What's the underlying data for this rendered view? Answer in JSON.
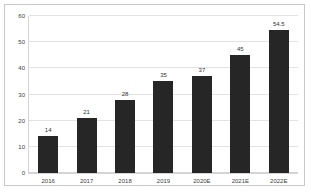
{
  "chart_data": {
    "type": "bar",
    "title": "",
    "subtitle": "",
    "xlabel": "",
    "ylabel": "",
    "categories": [
      "2016",
      "2017",
      "2018",
      "2019",
      "2020E",
      "2021E",
      "2022E"
    ],
    "values": [
      14,
      21,
      28,
      35,
      37,
      45,
      54.5
    ],
    "data_labels": [
      "14",
      "21",
      "28",
      "35",
      "37",
      "45",
      "54.5"
    ],
    "ylim": [
      0,
      60
    ],
    "ytick_labels": [
      "0",
      "10",
      "20",
      "30",
      "40",
      "50",
      "60"
    ],
    "ytick_values": [
      0,
      10,
      20,
      30,
      40,
      50,
      60
    ],
    "grid": true,
    "grid_axis": "y",
    "legend": null,
    "legend_position": "none",
    "series": [
      {
        "name": "",
        "values": [
          14,
          21,
          28,
          35,
          37,
          45,
          54.5
        ]
      }
    ]
  },
  "style": {
    "bar_color": "#262626",
    "grid_color": "#e3e3e3",
    "axis_color": "#d4d4d4",
    "frame_color": "#c9c9c9",
    "label_color": "#333333",
    "tick_color": "#3d3d3d",
    "background": "#ffffff"
  }
}
